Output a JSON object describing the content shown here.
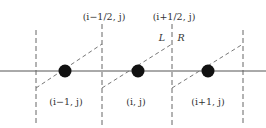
{
  "diagram": {
    "interfaces": [
      {
        "x": 36,
        "label": ""
      },
      {
        "x": 102,
        "label": "(i−1/2, j)"
      },
      {
        "x": 172,
        "label": "(i+1/2, j)"
      },
      {
        "x": 243,
        "label": ""
      }
    ],
    "cells": [
      {
        "center_x": 65,
        "label": "(i−1, j)"
      },
      {
        "center_x": 138,
        "label": "(i, j)"
      },
      {
        "center_x": 208,
        "label": "(i+1, j)"
      }
    ],
    "side_labels": {
      "left": "L",
      "right": "R"
    },
    "axis_y": 71,
    "colors": {
      "line": "#555555",
      "dashed": "#666666",
      "node": "#111111",
      "text": "#333333"
    }
  }
}
